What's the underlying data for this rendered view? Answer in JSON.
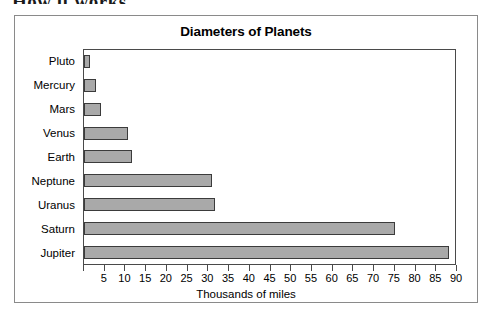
{
  "page": {
    "cut_off_heading": "How it works"
  },
  "chart_data": {
    "type": "bar",
    "orientation": "horizontal",
    "title": "Diameters of Planets",
    "xlabel": "Thousands of miles",
    "ylabel": "",
    "categories": [
      "Pluto",
      "Mercury",
      "Mars",
      "Venus",
      "Earth",
      "Neptune",
      "Uranus",
      "Saturn",
      "Jupiter"
    ],
    "values": [
      1.5,
      3,
      4.2,
      10.5,
      11.5,
      31,
      31.5,
      75,
      88
    ],
    "xlim": [
      0,
      90
    ],
    "xticks": [
      0,
      5,
      10,
      15,
      20,
      25,
      30,
      35,
      40,
      45,
      50,
      55,
      60,
      65,
      70,
      75,
      80,
      85,
      90
    ],
    "xtick_labels": [
      "",
      "5",
      "10",
      "15",
      "20",
      "25",
      "30",
      "35",
      "40",
      "45",
      "50",
      "55",
      "60",
      "65",
      "70",
      "75",
      "80",
      "85",
      "90"
    ],
    "grid": false,
    "legend": false,
    "colors": {
      "bar_fill": "#a9a9a9",
      "bar_border": "#3b3b3b",
      "axis": "#4a4a4a",
      "frame": "#8a8a8a",
      "background": "#ffffff",
      "text": "#000000"
    }
  }
}
